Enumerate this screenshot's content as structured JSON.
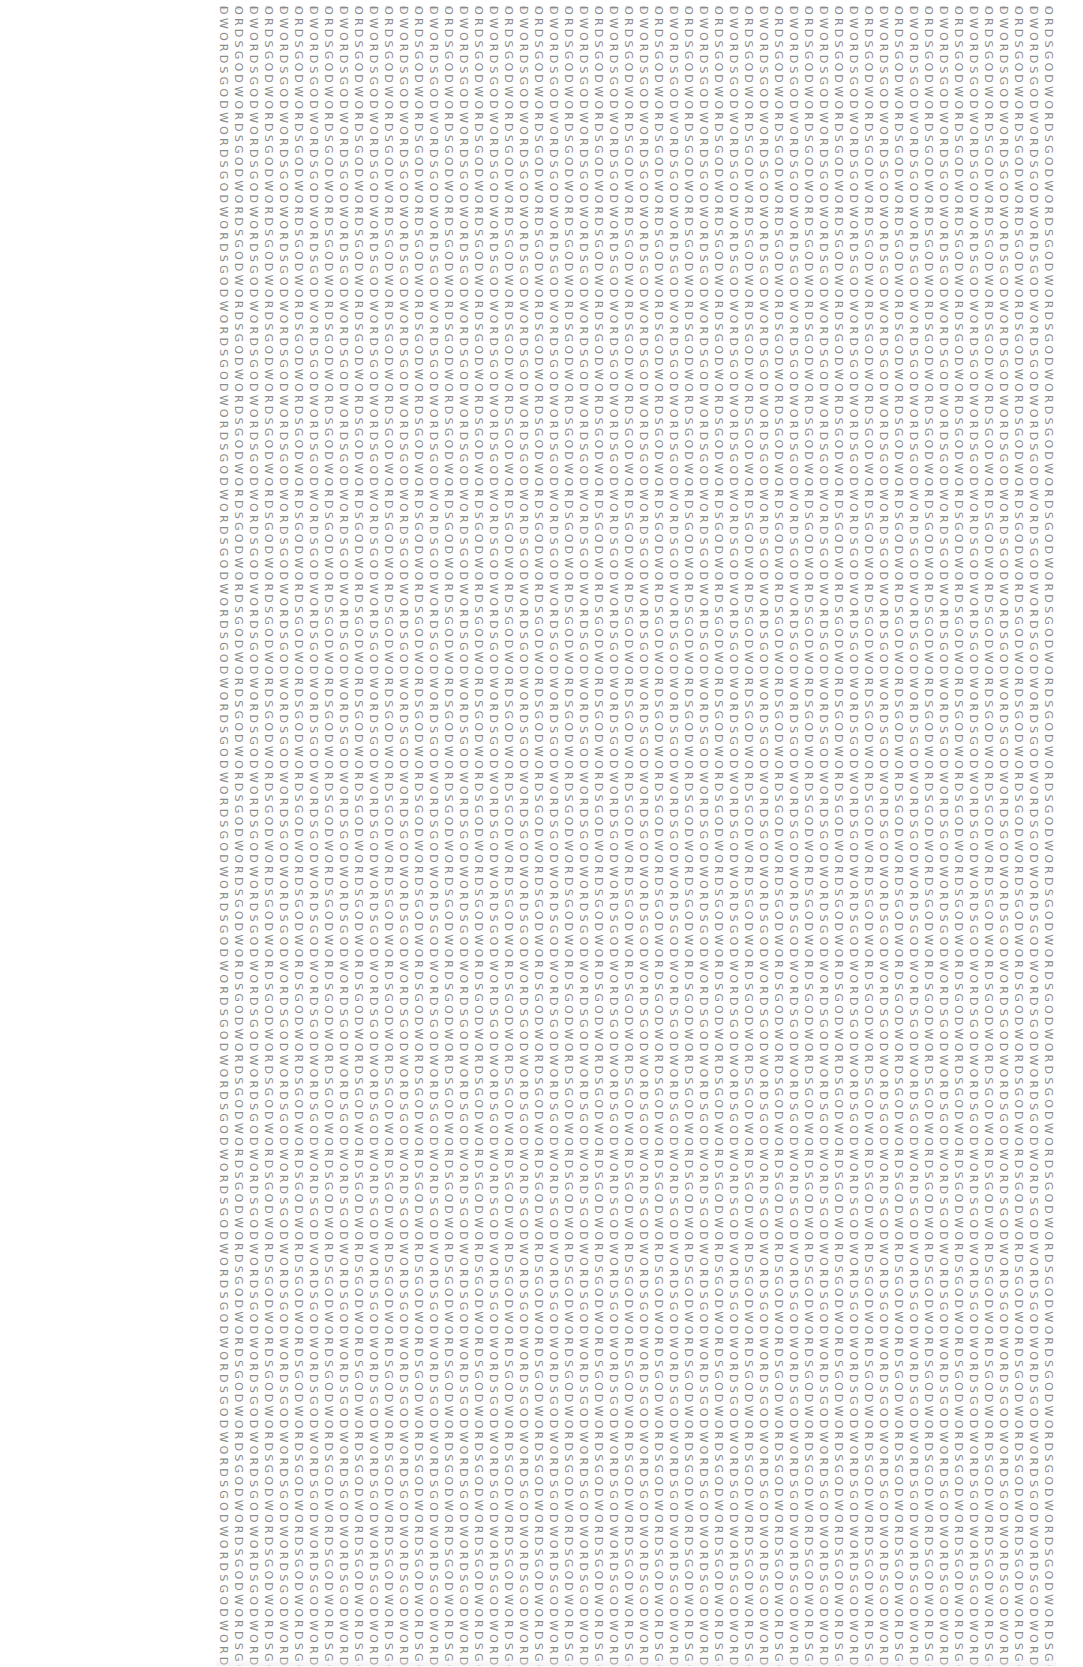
{
  "artwork": {
    "description": "Repeating vertical text columns of the phrase GOD WORDS",
    "base_phrase": "DWORDSGO",
    "column_start_variants": [
      "DWORDSGO",
      "ORDSGODW"
    ],
    "column_count": 56,
    "column_spacing_px": 15,
    "text_color": "#8a8a8a",
    "background_color": "#ffffff"
  },
  "columns": []
}
